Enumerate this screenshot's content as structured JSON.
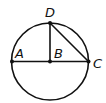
{
  "diagram": {
    "type": "circle-geometry",
    "circle": {
      "cx": 50,
      "cy": 61.5,
      "r": 38.5
    },
    "points": [
      {
        "id": "A",
        "label": "A",
        "x": 12,
        "y": 61.5,
        "lx": 15,
        "ly": 58
      },
      {
        "id": "B",
        "label": "B",
        "x": 50,
        "y": 61.5,
        "lx": 54,
        "ly": 58
      },
      {
        "id": "C",
        "label": "C",
        "x": 88.5,
        "y": 61.5,
        "lx": 93,
        "ly": 68
      },
      {
        "id": "D",
        "label": "D",
        "x": 50,
        "y": 23,
        "lx": 45,
        "ly": 17
      }
    ],
    "segments": [
      {
        "from": "A",
        "to": "C"
      },
      {
        "from": "B",
        "to": "D"
      },
      {
        "from": "D",
        "to": "C"
      }
    ],
    "stroke_color": "#111111"
  }
}
